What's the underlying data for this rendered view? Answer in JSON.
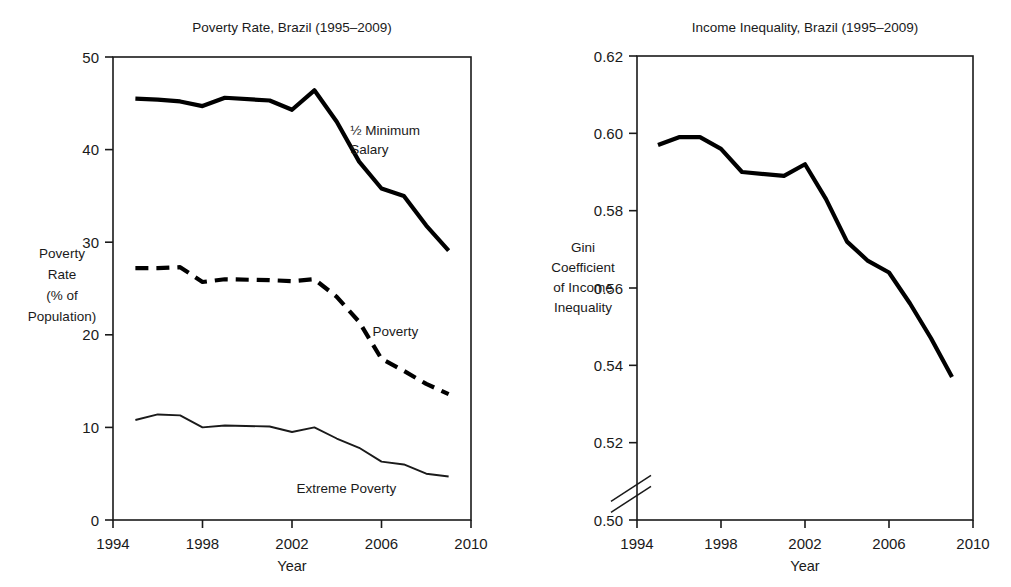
{
  "figure": {
    "background": "#ffffff",
    "ink": "#000000"
  },
  "chart_data": [
    {
      "type": "line",
      "id": "poverty-rate",
      "title": "Poverty Rate, Brazil (1995–2009)",
      "xlabel": "Year",
      "ylabel": "Poverty Rate (% of Population)",
      "ylabel_lines": [
        "Poverty",
        "Rate",
        "(% of",
        "Population)"
      ],
      "xlim": [
        1994,
        2010
      ],
      "ylim": [
        0,
        50
      ],
      "xticks": [
        1994,
        1998,
        2002,
        2006,
        2010
      ],
      "yticks": [
        0,
        10,
        20,
        30,
        40,
        50
      ],
      "grid": false,
      "legend": "inline-annotations",
      "x": [
        1995,
        1996,
        1997,
        1998,
        1999,
        2001,
        2002,
        2003,
        2004,
        2005,
        2006,
        2007,
        2008,
        2009
      ],
      "series": [
        {
          "name": "½ Minimum Salary",
          "style": "thick-solid",
          "label_lines": [
            "½ Minimum",
            "Salary"
          ],
          "values": [
            45.5,
            45.4,
            45.2,
            44.7,
            45.6,
            45.3,
            44.3,
            46.4,
            43.0,
            38.7,
            35.8,
            35.0,
            31.8,
            29.1
          ]
        },
        {
          "name": "Poverty",
          "style": "thick-dashed",
          "label_lines": [
            "Poverty"
          ],
          "values": [
            27.2,
            27.2,
            27.3,
            25.7,
            26.0,
            25.9,
            25.8,
            26.0,
            24.1,
            21.4,
            17.4,
            16.1,
            14.7,
            13.6
          ]
        },
        {
          "name": "Extreme Poverty",
          "style": "thin-solid",
          "label_lines": [
            "Extreme Poverty"
          ],
          "values": [
            10.8,
            11.4,
            11.3,
            10.0,
            10.2,
            10.1,
            9.5,
            10.0,
            8.8,
            7.8,
            6.3,
            6.0,
            5.0,
            4.7
          ]
        }
      ]
    },
    {
      "type": "line",
      "id": "income-inequality",
      "title": "Income Inequality, Brazil (1995–2009)",
      "xlabel": "Year",
      "ylabel": "Gini Coefficient of Income Inequality",
      "ylabel_lines": [
        "Gini",
        "Coefficient",
        "of Income",
        "Inequality"
      ],
      "xlim": [
        1994,
        2010
      ],
      "ylim": [
        0.5,
        0.62
      ],
      "xticks": [
        1994,
        1998,
        2002,
        2006,
        2010
      ],
      "yticks": [
        "0.50",
        "0.52",
        "0.54",
        "0.56",
        "0.58",
        "0.60",
        "0.62"
      ],
      "ytick_values": [
        0.5,
        0.52,
        0.54,
        0.56,
        0.58,
        0.6,
        0.62
      ],
      "axis_break": {
        "between": [
          0.5,
          0.52
        ],
        "style": "double-slash"
      },
      "grid": false,
      "x": [
        1995,
        1996,
        1997,
        1998,
        1999,
        2001,
        2002,
        2003,
        2004,
        2005,
        2006,
        2007,
        2008,
        2009
      ],
      "series": [
        {
          "name": "Gini Coefficient",
          "style": "thick-solid",
          "values": [
            0.597,
            0.599,
            0.599,
            0.596,
            0.59,
            0.589,
            0.592,
            0.583,
            0.572,
            0.567,
            0.564,
            0.556,
            0.547,
            0.537
          ]
        }
      ]
    }
  ]
}
